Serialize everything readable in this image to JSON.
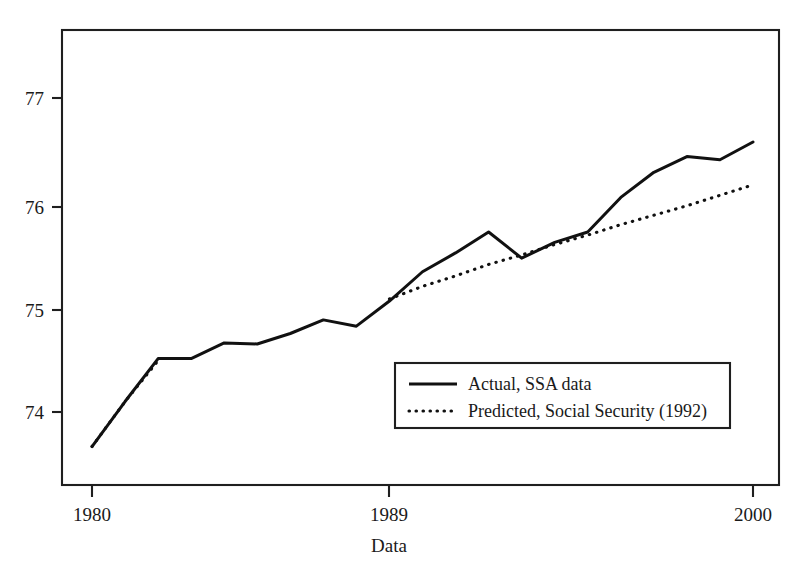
{
  "chart_data": {
    "type": "line",
    "title": "",
    "subtitle": "",
    "xlabel": "Data",
    "ylabel": "",
    "xlim": [
      1980,
      2000
    ],
    "ylim": [
      73.2,
      77.45
    ],
    "grid": false,
    "legend_position": "inside-lower-right",
    "x_tick_labels": [
      "1980",
      "1989",
      "2000"
    ],
    "x_tick_values": [
      1980,
      1989,
      2000
    ],
    "y_tick_labels": [
      "74",
      "75",
      "76",
      "77"
    ],
    "y_tick_values": [
      74,
      75,
      76,
      77
    ],
    "series": [
      {
        "name": "Actual, SSA data",
        "style": "solid",
        "color": "#111111",
        "x": [
          1980,
          1981,
          1982,
          1983,
          1984,
          1985,
          1986,
          1987,
          1988,
          1989,
          1990,
          1991,
          1992,
          1993,
          1994,
          1995,
          1996,
          1997,
          1998,
          1999,
          2000
        ],
        "values": [
          73.67,
          74.1,
          74.51,
          74.51,
          74.66,
          74.65,
          74.75,
          74.88,
          74.82,
          75.06,
          75.34,
          75.52,
          75.72,
          75.47,
          75.62,
          75.72,
          76.05,
          76.29,
          76.44,
          76.41,
          76.58
        ]
      },
      {
        "name": "Predicted, Social Security (1992)",
        "style": "dotted",
        "color": "#111111",
        "x": [
          1989,
          1990,
          1991,
          1992,
          1993,
          1994,
          1995,
          1996,
          1997,
          1998,
          1999,
          2000
        ],
        "values": [
          75.08,
          75.2,
          75.3,
          75.41,
          75.5,
          75.6,
          75.69,
          75.79,
          75.88,
          75.97,
          76.07,
          76.17
        ]
      },
      {
        "name": "Predicted, Social Security (1992) early segment",
        "style": "dotted",
        "color": "#111111",
        "x": [
          1980,
          1981,
          1982
        ],
        "values": [
          73.67,
          74.1,
          74.49
        ]
      }
    ],
    "legend": [
      {
        "label": "Actual, SSA data",
        "style": "solid"
      },
      {
        "label": "Predicted, Social Security (1992)",
        "style": "dotted"
      }
    ]
  },
  "colors": {
    "ink": "#111111",
    "frame": "#1f1f1f",
    "background": "#ffffff"
  }
}
